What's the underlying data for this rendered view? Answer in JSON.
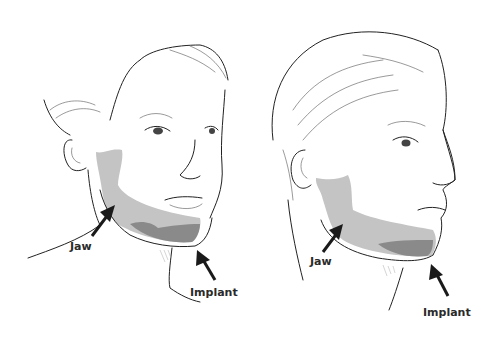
{
  "figures": [
    {
      "view": "three-quarter front",
      "labels": {
        "jaw": "Jaw",
        "implant": "Implant"
      }
    },
    {
      "view": "profile",
      "labels": {
        "jaw": "Jaw",
        "implant": "Implant"
      }
    }
  ],
  "colors": {
    "jaw_region": "#c4c4c4",
    "implant_region": "#8a8a8a",
    "outline": "#222222",
    "arrow": "#1a1a1a",
    "label": "#2a2a2a"
  }
}
